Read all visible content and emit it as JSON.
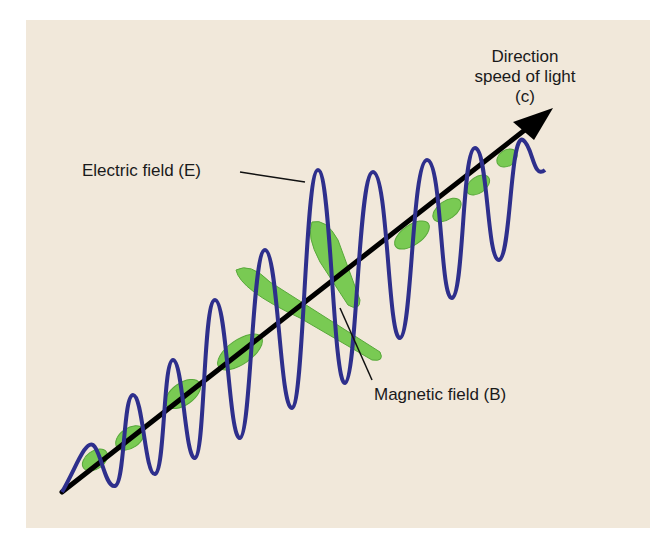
{
  "diagram": {
    "labels": {
      "direction_line1": "Direction",
      "direction_line2": "speed of light",
      "direction_line3": "(c)",
      "electric": "Electric field (E)",
      "magnetic": "Magnetic field (B)"
    },
    "colors": {
      "background": "#f1e8da",
      "electric_wave": "#2e2f8c",
      "magnetic_wave": "#6cc644",
      "axis": "#000000",
      "text": "#1a1a1a"
    }
  }
}
